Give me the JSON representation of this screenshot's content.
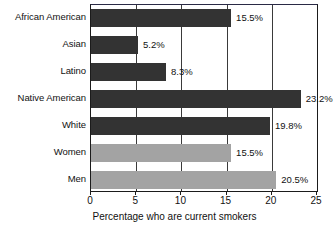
{
  "chart_data": {
    "type": "bar",
    "orientation": "horizontal",
    "title": "",
    "xlabel": "Percentage who are current smokers",
    "ylabel": "",
    "xlim": [
      0,
      25
    ],
    "xticks": [
      0,
      5,
      10,
      15,
      20,
      25
    ],
    "xtick_labels": [
      "0",
      "5",
      "10",
      "15",
      "20",
      "25"
    ],
    "grid": true,
    "grid_axis": "x",
    "legend": "none",
    "categories": [
      "African American",
      "Asian",
      "Latino",
      "Native American",
      "White",
      "Women",
      "Men"
    ],
    "values": [
      15.5,
      5.2,
      8.3,
      23.2,
      19.8,
      15.5,
      20.5
    ],
    "value_labels": [
      "15.5%",
      "5.2%",
      "8.3%",
      "23.2%",
      "19.8%",
      "15.5%",
      "20.5%"
    ],
    "bar_colors": [
      "#333333",
      "#333333",
      "#333333",
      "#333333",
      "#333333",
      "#a3a3a3",
      "#a3a3a3"
    ],
    "series_groups": [
      {
        "name": "Race/ethnicity",
        "color": "#333333",
        "categories": [
          "African American",
          "Asian",
          "Latino",
          "Native American",
          "White"
        ]
      },
      {
        "name": "Sex",
        "color": "#a3a3a3",
        "categories": [
          "Women",
          "Men"
        ]
      }
    ],
    "axis_color": "#1b1b1b",
    "grid_color": "#3a3a3a",
    "background": "#ffffff"
  }
}
